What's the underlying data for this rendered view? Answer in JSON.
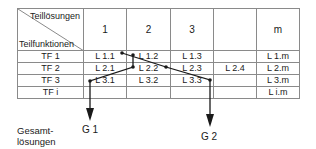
{
  "table": {
    "corner": {
      "top_label": "Teillösungen",
      "bottom_label": "Teilfunktionen"
    },
    "columns": [
      "1",
      "2",
      "3",
      "",
      "m"
    ],
    "rows": [
      {
        "label": "TF 1",
        "cells": [
          "L 1.1",
          "L 1.2",
          "L 1.3",
          "",
          "L 1.m"
        ]
      },
      {
        "label": "TF 2",
        "cells": [
          "L 2.1",
          "L 2.2",
          "L 2.3",
          "L 2.4",
          "L 2.m"
        ]
      },
      {
        "label": "TF 3",
        "cells": [
          "L 3.1",
          "L 3.2",
          "L 3.3",
          "",
          "L 3.m"
        ]
      },
      {
        "label": "TF i",
        "cells": [
          "",
          "",
          "",
          "",
          "L i.m"
        ]
      }
    ]
  },
  "paths": [
    {
      "name": "G 1",
      "via": [
        "L 1.2",
        "L 2.1",
        "L 3.1"
      ]
    },
    {
      "name": "G 2",
      "via": [
        "L 1.1",
        "L 2.2",
        "L 3.3"
      ]
    }
  ],
  "results": {
    "g1": "G 1",
    "g2": "G 2"
  },
  "footer": {
    "line1": "Gesamt-",
    "line2": "lösungen"
  },
  "colors": {
    "grid": "#8a8a8a",
    "line": "#1a1a1a"
  }
}
